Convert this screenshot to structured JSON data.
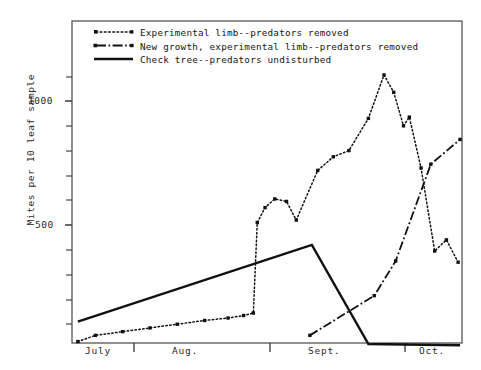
{
  "chart_data": {
    "type": "line",
    "title": "",
    "xlabel": "",
    "ylabel": "Mites per 10 leaf sample",
    "ylim": [
      0,
      1200
    ],
    "xlim": [
      0,
      100
    ],
    "grid": false,
    "legend_position": "top-left",
    "y_ticks_labeled": [
      "1000",
      "500"
    ],
    "y_tick_values": [
      1000,
      500
    ],
    "y_minor_ticks": [
      100,
      200,
      300,
      400,
      600,
      700,
      800,
      900,
      1100
    ],
    "x_tick_labels": [
      "July",
      "Aug.",
      "Sept.",
      "Oct."
    ],
    "series": [
      {
        "name": "Experimental limb--predators removed",
        "style": "dotted",
        "marker": "square",
        "points": [
          [
            1.5,
            30
          ],
          [
            6,
            55
          ],
          [
            13,
            70
          ],
          [
            20,
            85
          ],
          [
            27,
            100
          ],
          [
            34,
            115
          ],
          [
            40,
            125
          ],
          [
            44,
            135
          ],
          [
            46.5,
            145
          ],
          [
            47.5,
            510
          ],
          [
            49.5,
            570
          ],
          [
            52,
            605
          ],
          [
            55,
            595
          ],
          [
            57.5,
            520
          ],
          [
            63,
            720
          ],
          [
            67,
            775
          ],
          [
            71,
            800
          ],
          [
            76,
            930
          ],
          [
            80,
            1105
          ],
          [
            82.5,
            1035
          ],
          [
            85,
            900
          ],
          [
            86.5,
            935
          ],
          [
            89.5,
            730
          ],
          [
            93,
            395
          ],
          [
            96,
            440
          ],
          [
            99,
            350
          ]
        ]
      },
      {
        "name": "New growth, experimental limb--predators removed",
        "style": "dash-dot",
        "marker": "square",
        "points": [
          [
            61,
            55
          ],
          [
            77.5,
            215
          ],
          [
            83,
            355
          ],
          [
            92,
            745
          ],
          [
            99.5,
            845
          ]
        ]
      },
      {
        "name": "Check tree--predators undisturbed",
        "style": "solid",
        "marker": "none",
        "points": [
          [
            1.5,
            110
          ],
          [
            61.5,
            420
          ],
          [
            76,
            20
          ],
          [
            99.5,
            15
          ]
        ]
      }
    ]
  },
  "legend": {
    "items": [
      {
        "label": "Experimental limb--predators removed",
        "style": "dotted"
      },
      {
        "label": "New growth, experimental limb--predators removed",
        "style": "dash-dot"
      },
      {
        "label": "Check tree--predators undisturbed",
        "style": "solid"
      }
    ]
  },
  "axes": {
    "y_label": "Mites per 10 leaf sample",
    "y_tick_1000": "1000",
    "y_tick_500": "500",
    "x_labels": {
      "july": "July",
      "aug": "Aug.",
      "sept": "Sept.",
      "oct": "Oct."
    }
  }
}
